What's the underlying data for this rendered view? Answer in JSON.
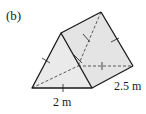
{
  "figure": {
    "part_label": "(b)",
    "shape": "triangular-prism",
    "dimensions": {
      "base_edge": "2 m",
      "length": "2.5 m"
    },
    "equal_edge_marks": true,
    "colors": {
      "face_fill": "#ececec",
      "edge": "#1a1a1a",
      "hidden_edge": "#333333"
    }
  }
}
